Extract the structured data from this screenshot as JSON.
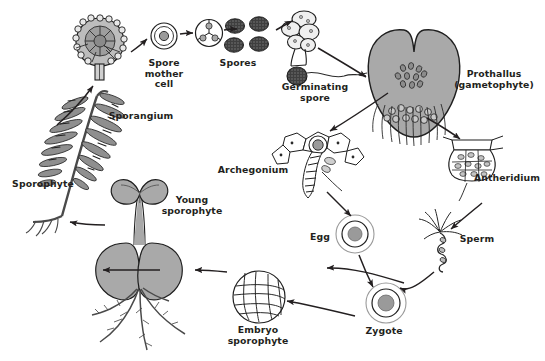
{
  "diagram": {
    "type": "biological-life-cycle",
    "style": {
      "background": "#ffffff",
      "ink": "#231f20",
      "fill_gray": "#a9a9a9",
      "fill_light": "#d9d9d9",
      "spore_dark": "#4a4a4a"
    }
  },
  "labels": {
    "sporangium": "Sporangium",
    "spore_mother_cell": "Spore\nmother\ncell",
    "spores": "Spores",
    "germinating_spore": "Germinating\nspore",
    "prothallus": "Prothallus\n(gametophyte)",
    "archegonium": "Archegonium",
    "antheridium": "Antheridium",
    "egg": "Egg",
    "sperm": "Sperm",
    "zygote": "Zygote",
    "embryo_sporophyte": "Embryo\nsporophyte",
    "young_sporophyte": "Young\nsporophyte",
    "sporophyte": "Sporophyte"
  },
  "stages": [
    {
      "id": "sporophyte",
      "label": "Sporophyte",
      "x": 42,
      "y": 185
    },
    {
      "id": "sporangium",
      "label": "Sporangium",
      "x": 140,
      "y": 117
    },
    {
      "id": "spore-mother-cell",
      "label": "Spore mother cell",
      "x": 163,
      "y": 63
    },
    {
      "id": "spores",
      "label": "Spores",
      "x": 238,
      "y": 63
    },
    {
      "id": "germinating-spore",
      "label": "Germinating spore",
      "x": 314,
      "y": 87
    },
    {
      "id": "prothallus",
      "label": "Prothallus (gametophyte)",
      "x": 492,
      "y": 80
    },
    {
      "id": "archegonium",
      "label": "Archegonium",
      "x": 253,
      "y": 170
    },
    {
      "id": "antheridium",
      "label": "Antheridium",
      "x": 508,
      "y": 178
    },
    {
      "id": "egg",
      "label": "Egg",
      "x": 322,
      "y": 237
    },
    {
      "id": "sperm",
      "label": "Sperm",
      "x": 477,
      "y": 239
    },
    {
      "id": "zygote",
      "label": "Zygote",
      "x": 384,
      "y": 331
    },
    {
      "id": "embryo-sporophyte",
      "label": "Embryo sporophyte",
      "x": 258,
      "y": 325
    },
    {
      "id": "young-sporophyte",
      "label": "Young sporophyte",
      "x": 192,
      "y": 200
    }
  ],
  "arrows": [
    {
      "from": "sporophyte",
      "to": "sporangium"
    },
    {
      "from": "sporangium",
      "to": "spore-mother-cell"
    },
    {
      "from": "spore-mother-cell",
      "to": "tetrad"
    },
    {
      "from": "tetrad",
      "to": "spores"
    },
    {
      "from": "spores",
      "to": "germinating-spore"
    },
    {
      "from": "germinating-spore",
      "to": "prothallus"
    },
    {
      "from": "prothallus",
      "to": "archegonium"
    },
    {
      "from": "prothallus",
      "to": "antheridium"
    },
    {
      "from": "archegonium",
      "to": "egg"
    },
    {
      "from": "antheridium",
      "to": "sperm"
    },
    {
      "from": "egg",
      "to": "zygote"
    },
    {
      "from": "sperm",
      "to": "zygote"
    },
    {
      "from": "zygote",
      "to": "embryo-sporophyte"
    },
    {
      "from": "embryo-sporophyte",
      "to": "young-sporophyte"
    },
    {
      "from": "young-sporophyte",
      "to": "sporophyte"
    }
  ]
}
